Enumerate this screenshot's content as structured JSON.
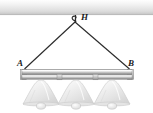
{
  "figure": {
    "background_color": "#ffffff",
    "width": 153,
    "height": 113
  },
  "ceiling": {
    "name": "ceiling-beam",
    "color_top": "#fdfdfd",
    "color_mid": "#e6e6e6",
    "color_bottom": "#c9c9c9",
    "y": 0,
    "height": 15
  },
  "hook": {
    "label": "H",
    "name": "ceiling-hook",
    "x": 75,
    "y": 20,
    "color": "#2b2b2b"
  },
  "cables": [
    {
      "name": "cable-left",
      "from": "H",
      "to": "A",
      "x1": 75,
      "y1": 22,
      "x2": 24,
      "y2": 70,
      "color": "#2b2b2b"
    },
    {
      "name": "cable-right",
      "from": "H",
      "to": "B",
      "x1": 75,
      "y1": 22,
      "x2": 130,
      "y2": 70,
      "color": "#2b2b2b"
    }
  ],
  "points": [
    {
      "label": "A",
      "name": "attachment-point-a",
      "x": 24,
      "y": 70
    },
    {
      "label": "B",
      "name": "attachment-point-b",
      "x": 130,
      "y": 70
    }
  ],
  "bar": {
    "name": "horizontal-fixture-bar",
    "x": 20,
    "y": 70,
    "width": 114,
    "height": 9,
    "color_light": "#f2f2f2",
    "color_mid": "#b8b8b8",
    "color_dark": "#8d8d8d",
    "end_caps": 2,
    "collars": 2
  },
  "lamps": [
    {
      "name": "lamp-shade-left",
      "cx": 41,
      "top_y": 80,
      "shade_color": "#ececec",
      "highlight_color": "#fafafa"
    },
    {
      "name": "lamp-shade-center",
      "cx": 76,
      "top_y": 80,
      "shade_color": "#ececec",
      "highlight_color": "#fafafa"
    },
    {
      "name": "lamp-shade-right",
      "cx": 112,
      "top_y": 80,
      "shade_color": "#ececec",
      "highlight_color": "#fafafa"
    }
  ],
  "colors": {
    "line": "#2b2b2b",
    "metal_light": "#f4f4f4",
    "metal_mid": "#b5b5b5",
    "metal_dark": "#868686",
    "glass": "#ededed",
    "glass_edge": "#c4c4c4",
    "background": "#ffffff"
  }
}
